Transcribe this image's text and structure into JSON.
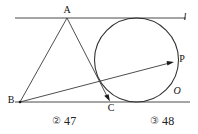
{
  "figure": {
    "name": "circle-tangent-two-parallel-lines",
    "labels": {
      "line_l": "l",
      "point_a": "A",
      "point_b": "B",
      "point_c": "C",
      "point_p": "P",
      "center_o": "O"
    },
    "colors": {
      "stroke": "#3a3a3a",
      "circle": "#2e2e2e",
      "text": "#111111",
      "background": "#ffffff"
    },
    "geometry": {
      "top_line": {
        "x1": 15,
        "y1": 18,
        "x2": 186,
        "y2": 18
      },
      "bottom_line": {
        "x1": 15,
        "y1": 102,
        "x2": 190,
        "y2": 102
      },
      "circle": {
        "cx": 136.5,
        "cy": 60,
        "r": 42
      },
      "point_a": {
        "x": 67,
        "y": 18
      },
      "point_b": {
        "x": 20,
        "y": 102
      },
      "point_c": {
        "x": 110,
        "y": 101
      },
      "point_p": {
        "x": 174,
        "y": 62
      },
      "segment_ab": {
        "x1": 67,
        "y1": 18,
        "x2": 20,
        "y2": 102
      },
      "segment_ac": {
        "x1": 67,
        "y1": 18,
        "x2": 110,
        "y2": 101
      },
      "ray_bp": {
        "x1": 20,
        "y1": 102,
        "x2": 174,
        "y2": 62
      }
    }
  },
  "answers": {
    "options": [
      {
        "marker": "②",
        "value": "47"
      },
      {
        "marker": "③",
        "value": "48"
      }
    ]
  }
}
